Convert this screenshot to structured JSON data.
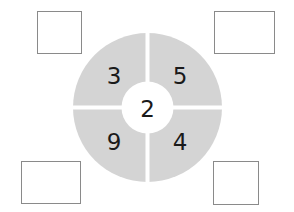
{
  "diagram": {
    "center_number": "2",
    "segments": [
      {
        "position": "top-left",
        "number": "3"
      },
      {
        "position": "top-right",
        "number": "5"
      },
      {
        "position": "bottom-left",
        "number": "9"
      },
      {
        "position": "bottom-right",
        "number": "4"
      }
    ],
    "answer_boxes": [
      {
        "position": "top-left",
        "value": ""
      },
      {
        "position": "top-right",
        "value": ""
      },
      {
        "position": "bottom-left",
        "value": ""
      },
      {
        "position": "bottom-right",
        "value": ""
      }
    ],
    "colors": {
      "ring": "#d4d4d4",
      "center": "#ffffff",
      "box_border": "#8a8a8a",
      "text": "#1a1a1a"
    }
  }
}
